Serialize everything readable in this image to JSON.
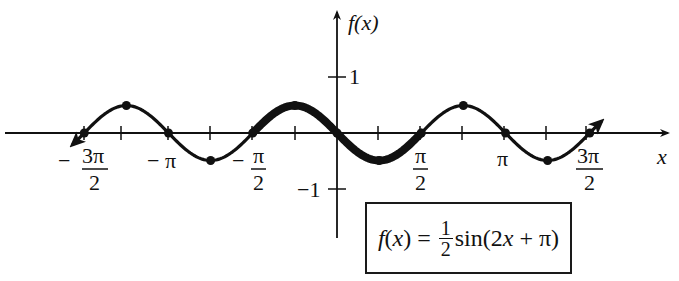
{
  "chart_data": {
    "type": "line",
    "title": "",
    "function": "f(x) = 1/2 sin(2x + π)",
    "xlabel": "x",
    "ylabel": "f(x)",
    "xlim": [
      -4.9,
      4.9
    ],
    "ylim": [
      -1.8,
      2.1
    ],
    "grid": false,
    "legend": null,
    "x_tick_labels": [
      "-3π/2",
      "-π",
      "-π/2",
      "π/2",
      "π",
      "3π/2"
    ],
    "x_tick_positions": [
      "-3π/2",
      "-5π/4",
      "-π",
      "-3π/4",
      "-π/2",
      "-π/4",
      "π/4",
      "π/2",
      "3π/4",
      "π",
      "5π/4",
      "3π/2"
    ],
    "y_tick_labels": [
      "1",
      "-1"
    ],
    "y_tick_values": [
      1,
      -1
    ],
    "key_points": {
      "x": [
        "-3π/2",
        "-5π/4",
        "-π",
        "-3π/4",
        "-π/2",
        "-π/4",
        "0",
        "π/4",
        "π/2",
        "3π/4",
        "π",
        "5π/4",
        "3π/2"
      ],
      "x_numeric": [
        -4.712,
        -3.927,
        -3.142,
        -2.356,
        -1.571,
        -0.785,
        0,
        0.785,
        1.571,
        2.356,
        3.142,
        3.927,
        4.712
      ],
      "y": [
        0,
        0.5,
        0,
        -0.5,
        0,
        0.5,
        0,
        -0.5,
        0,
        0.5,
        0,
        -0.5,
        0
      ]
    },
    "highlighted_interval": {
      "from": "-π/2",
      "to": "π/2",
      "style": "bold"
    },
    "amplitude": 0.5,
    "period": "π",
    "annotation": "f(x) = 1/2 sin(2x + π)"
  },
  "axes": {
    "x_label": "x",
    "y_label": "f(x)",
    "y_tick_pos": "1",
    "y_tick_neg": "−1"
  },
  "x_labels": {
    "neg_three_pi_over_2": {
      "sign": "−",
      "num": "3π",
      "den": "2"
    },
    "neg_pi": "− π",
    "neg_pi_over_2": {
      "sign": "−",
      "num": "π",
      "den": "2"
    },
    "pi_over_2": {
      "num": "π",
      "den": "2"
    },
    "pi": "π",
    "three_pi_over_2": {
      "num": "3π",
      "den": "2"
    }
  },
  "formula": {
    "lhs": "f(x) = ",
    "frac_num": "1",
    "frac_den": "2",
    "rhs": "sin(2x + π)"
  }
}
